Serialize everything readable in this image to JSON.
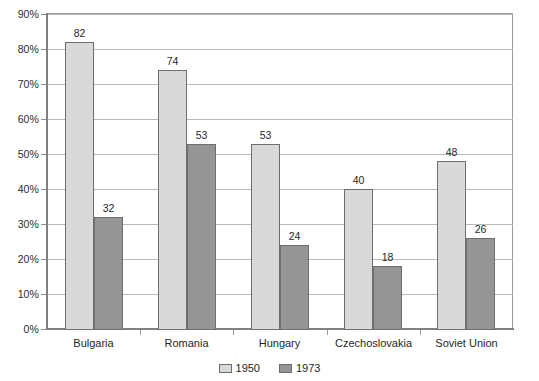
{
  "chart_data": {
    "type": "bar",
    "title": "",
    "subtitle": "",
    "xlabel": "",
    "ylabel": "",
    "categories": [
      "Bulgaria",
      "Romania",
      "Hungary",
      "Czechoslovakia",
      "Soviet Union"
    ],
    "series": [
      {
        "name": "1950",
        "color": "#d9d9d9",
        "values": [
          82,
          74,
          53,
          40,
          48
        ]
      },
      {
        "name": "1973",
        "color": "#959595",
        "values": [
          32,
          53,
          24,
          18,
          26
        ]
      }
    ],
    "ylim": [
      0,
      90
    ],
    "ytick_values": [
      0,
      10,
      20,
      30,
      40,
      50,
      60,
      70,
      80,
      90
    ],
    "ytick_labels": [
      "0%",
      "10%",
      "20%",
      "30%",
      "40%",
      "50%",
      "60%",
      "70%",
      "80%",
      "90%"
    ],
    "grid": true,
    "grid_axis": "y",
    "legend_position": "bottom",
    "data_labels": true,
    "data_label_values": [
      [
        "82",
        "32"
      ],
      [
        "74",
        "53"
      ],
      [
        "53",
        "24"
      ],
      [
        "40",
        "18"
      ],
      [
        "48",
        "26"
      ]
    ]
  },
  "legend": {
    "items": [
      {
        "label": "1950",
        "swatch": "legend-swatch-1950"
      },
      {
        "label": "1973",
        "swatch": "legend-swatch-1973"
      }
    ]
  }
}
